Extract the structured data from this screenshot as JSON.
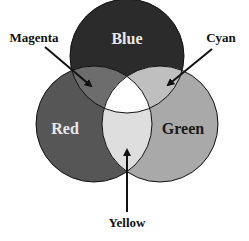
{
  "diagram": {
    "type": "venn",
    "sets": [
      {
        "name": "Blue",
        "label": "Blue",
        "fill": "#2b2b2b",
        "label_color": "#e8e8e8"
      },
      {
        "name": "Red",
        "label": "Red",
        "fill": "#565656",
        "label_color": "#e8e8e8"
      },
      {
        "name": "Green",
        "label": "Green",
        "fill": "#a9a9a9",
        "label_color": "#1a1a1a"
      }
    ],
    "intersections": [
      {
        "sets": [
          "Blue",
          "Red"
        ],
        "label": "Magenta",
        "fill": "#6d6d6d"
      },
      {
        "sets": [
          "Blue",
          "Green"
        ],
        "label": "Cyan",
        "fill": "#bfbfbf"
      },
      {
        "sets": [
          "Red",
          "Green"
        ],
        "label": "Yellow",
        "fill": "#dedede"
      },
      {
        "sets": [
          "Blue",
          "Red",
          "Green"
        ],
        "label": "",
        "fill": "#ffffff"
      }
    ],
    "callouts": {
      "magenta": "Magenta",
      "cyan": "Cyan",
      "yellow": "Yellow"
    }
  }
}
